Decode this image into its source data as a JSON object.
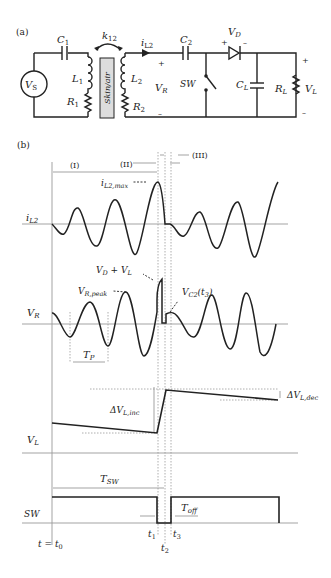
{
  "panel_a": {
    "label": "(a)",
    "source": "V",
    "source_sub": "S",
    "c1": "C",
    "c1_sub": "1",
    "l1": "L",
    "l1_sub": "1",
    "r1": "R",
    "r1_sub": "1",
    "coupling": "k",
    "coupling_sub": "12",
    "medium": "Skin/air",
    "l2": "L",
    "l2_sub": "2",
    "r2": "R",
    "r2_sub": "2",
    "current": "i",
    "current_sub": "L2",
    "c2": "C",
    "c2_sub": "2",
    "vr": "V",
    "vr_sub": "R",
    "plus": "+",
    "minus": "–",
    "switch": "SW",
    "vd": "V",
    "vd_sub": "D",
    "cl": "C",
    "cl_sub": "L",
    "rl": "R",
    "rl_sub": "L",
    "vl": "V",
    "vl_sub": "L"
  },
  "panel_b": {
    "label": "(b)",
    "phase_1": "(I)",
    "phase_2": "(II)",
    "phase_3": "(III)",
    "il2_axis": "i",
    "il2_axis_sub": "L2",
    "il2_max": "i",
    "il2_max_sub": "L2,max",
    "vd_vl": "V",
    "vd_vl_sub": "D",
    "vd_vl_plus": " + V",
    "vd_vl_sub2": "L",
    "vr_axis": "V",
    "vr_axis_sub": "R",
    "vr_peak": "V",
    "vr_peak_sub": "R,peak",
    "vc2": "V",
    "vc2_sub": "C2",
    "vc2_arg": "(t",
    "vc2_arg_sub": "3",
    "vc2_close": ")",
    "tp": "T",
    "tp_sub": "P",
    "dvl_inc": "ΔV",
    "dvl_inc_sub": "L,inc",
    "dvl_dec": "ΔV",
    "dvl_dec_sub": "L,dec",
    "vl_axis": "V",
    "vl_axis_sub": "L",
    "tsw": "T",
    "tsw_sub": "SW",
    "sw_axis": "SW",
    "toff": "T",
    "toff_sub": "off",
    "t1": "t",
    "t1_sub": "1",
    "t2": "t",
    "t2_sub": "2",
    "t3": "t",
    "t3_sub": "3",
    "t0": "t = t",
    "t0_sub": "0"
  }
}
